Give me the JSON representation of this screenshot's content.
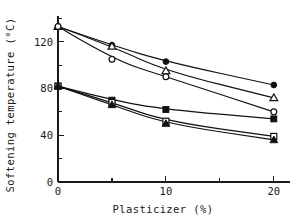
{
  "chart_data": {
    "type": "line",
    "title": "",
    "xlabel": "Plasticizer (%)",
    "ylabel": "Softening temperature (°C)",
    "xlim": [
      0,
      21.5
    ],
    "ylim": [
      0,
      142
    ],
    "grid": false,
    "legend": "none",
    "x": [
      0,
      5,
      10,
      20
    ],
    "xticks": [
      0,
      5,
      10,
      15,
      20
    ],
    "xticklabels": [
      "0",
      "",
      "10",
      "",
      "20"
    ],
    "yticks": [
      0,
      20,
      40,
      60,
      80,
      100,
      120,
      140
    ],
    "yticklabels": [
      "0",
      "",
      "40",
      "",
      "80",
      "",
      "120",
      ""
    ],
    "series": [
      {
        "name": "upper-filled-circle",
        "marker": "filled-circle",
        "values": [
          133,
          117,
          103,
          83
        ]
      },
      {
        "name": "upper-open-triangle",
        "marker": "open-triangle",
        "values": [
          133,
          116,
          95,
          72
        ]
      },
      {
        "name": "upper-open-circle",
        "marker": "open-circle",
        "values": [
          133,
          105,
          90,
          60
        ]
      },
      {
        "name": "lower-filled-square",
        "marker": "filled-square",
        "values": [
          82,
          70,
          62,
          54
        ]
      },
      {
        "name": "lower-open-square",
        "marker": "open-square",
        "values": [
          82,
          68,
          52,
          39
        ]
      },
      {
        "name": "lower-filled-triangle",
        "marker": "filled-triangle",
        "values": [
          82,
          66,
          50,
          36
        ]
      }
    ]
  },
  "axes": {
    "xlabel": "Plasticizer (%)",
    "ylabel": "Softening temperature (°C)",
    "ytick_0": "0",
    "ytick_40": "40",
    "ytick_80": "80",
    "ytick_120": "120",
    "xtick_0": "0",
    "xtick_10": "10",
    "xtick_20": "20"
  },
  "colors": {
    "ink": "#111111",
    "background": "#ffffff"
  }
}
